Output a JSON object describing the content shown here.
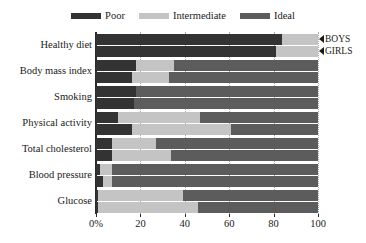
{
  "chart_data": {
    "type": "bar",
    "orientation": "horizontal",
    "stacked": true,
    "title": "",
    "subtitle": "",
    "xlabel": "",
    "ylabel": "",
    "xlim": [
      0,
      100
    ],
    "xticks": [
      0,
      20,
      40,
      60,
      80,
      100
    ],
    "xtick_labels": [
      "0%",
      "20",
      "40",
      "60",
      "80",
      "100"
    ],
    "grid": true,
    "grid_axis": "x",
    "grid_style": "dotted",
    "legend_position": "top-center",
    "categories": [
      "Healthy diet",
      "Body mass index",
      "Smoking",
      "Physical activity",
      "Total cholesterol",
      "Blood pressure",
      "Glucose"
    ],
    "series": [
      {
        "name": "Poor",
        "color": "#333333"
      },
      {
        "name": "Intermediate",
        "color": "#c4c4c4"
      },
      {
        "name": "Ideal",
        "color": "#5c5c5c"
      }
    ],
    "groups": [
      {
        "name": "BOYS",
        "marker": "triangle-left"
      },
      {
        "name": "GIRLS",
        "marker": "triangle-left"
      }
    ],
    "data": [
      {
        "category": "Healthy diet",
        "boys": {
          "Poor": 84,
          "Intermediate": 16,
          "Ideal": 0
        },
        "girls": {
          "Poor": 81,
          "Intermediate": 19,
          "Ideal": 0
        }
      },
      {
        "category": "Body mass index",
        "boys": {
          "Poor": 18,
          "Intermediate": 17,
          "Ideal": 65
        },
        "girls": {
          "Poor": 16,
          "Intermediate": 17,
          "Ideal": 67
        }
      },
      {
        "category": "Smoking",
        "boys": {
          "Poor": 18,
          "Intermediate": 0,
          "Ideal": 82
        },
        "girls": {
          "Poor": 17,
          "Intermediate": 0,
          "Ideal": 83
        }
      },
      {
        "category": "Physical activity",
        "boys": {
          "Poor": 10,
          "Intermediate": 37,
          "Ideal": 53
        },
        "girls": {
          "Poor": 16,
          "Intermediate": 45,
          "Ideal": 39
        }
      },
      {
        "category": "Total cholesterol",
        "boys": {
          "Poor": 7,
          "Intermediate": 20,
          "Ideal": 73
        },
        "girls": {
          "Poor": 7,
          "Intermediate": 27,
          "Ideal": 66
        }
      },
      {
        "category": "Blood pressure",
        "boys": {
          "Poor": 2,
          "Intermediate": 5,
          "Ideal": 93
        },
        "girls": {
          "Poor": 3,
          "Intermediate": 4,
          "Ideal": 93
        }
      },
      {
        "category": "Glucose",
        "boys": {
          "Poor": 1,
          "Intermediate": 38,
          "Ideal": 61
        },
        "girls": {
          "Poor": 1,
          "Intermediate": 45,
          "Ideal": 54
        }
      }
    ]
  },
  "legend": {
    "items": [
      {
        "label": "Poor",
        "color": "#333333"
      },
      {
        "label": "Intermediate",
        "color": "#c4c4c4"
      },
      {
        "label": "Ideal",
        "color": "#5c5c5c"
      }
    ]
  },
  "annotations": [
    {
      "label": "BOYS"
    },
    {
      "label": "GIRLS"
    }
  ],
  "colors": {
    "poor": "#333333",
    "intermediate": "#c4c4c4",
    "ideal": "#5c5c5c",
    "axis": "#2b2b2b",
    "grid": "#9a9a9a",
    "text": "#1a1a1a",
    "background": "#ffffff"
  }
}
